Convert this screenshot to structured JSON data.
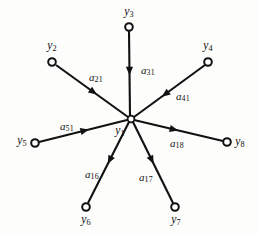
{
  "figure": {
    "kind": "signal-flow-graph",
    "background_color": "#fdfdfc",
    "ink_color": "#111111",
    "width": 258,
    "height": 235
  },
  "nodes": [
    {
      "id": "y1",
      "label": "y",
      "subscript": "1",
      "cx": 131,
      "cy": 119,
      "r": 3.4,
      "label_x": 120,
      "label_y": 132,
      "is_center": true
    },
    {
      "id": "y2",
      "label": "y",
      "subscript": "2",
      "cx": 52,
      "cy": 62,
      "r": 3.8,
      "label_x": 52,
      "label_y": 47,
      "is_center": false
    },
    {
      "id": "y3",
      "label": "y",
      "subscript": "3",
      "cx": 129,
      "cy": 27,
      "r": 3.8,
      "label_x": 129,
      "label_y": 13,
      "is_center": false
    },
    {
      "id": "y4",
      "label": "y",
      "subscript": "4",
      "cx": 208,
      "cy": 62,
      "r": 3.8,
      "label_x": 208,
      "label_y": 47,
      "is_center": false
    },
    {
      "id": "y5",
      "label": "y",
      "subscript": "5",
      "cx": 35,
      "cy": 143,
      "r": 3.8,
      "label_x": 22,
      "label_y": 142,
      "is_center": false
    },
    {
      "id": "y6",
      "label": "y",
      "subscript": "6",
      "cx": 86,
      "cy": 207,
      "r": 3.8,
      "label_x": 86,
      "label_y": 221,
      "is_center": false
    },
    {
      "id": "y7",
      "label": "y",
      "subscript": "7",
      "cx": 175,
      "cy": 207,
      "r": 3.8,
      "label_x": 176,
      "label_y": 221,
      "is_center": false
    },
    {
      "id": "y8",
      "label": "y",
      "subscript": "8",
      "cx": 227,
      "cy": 142,
      "r": 3.8,
      "label_x": 240,
      "label_y": 143,
      "is_center": false
    }
  ],
  "edges": [
    {
      "id": "a21",
      "label": "a",
      "subscript": "21",
      "from": "y2",
      "to": "y1",
      "x1": 56,
      "y1": 65,
      "x2": 128,
      "y2": 117,
      "arrow_t": 0.52,
      "label_x": 96,
      "label_y": 78
    },
    {
      "id": "a31",
      "label": "a",
      "subscript": "31",
      "from": "y3",
      "to": "y1",
      "x1": 129,
      "y1": 31,
      "x2": 130,
      "y2": 116,
      "arrow_t": 0.47,
      "label_x": 148,
      "label_y": 71
    },
    {
      "id": "a41",
      "label": "a",
      "subscript": "41",
      "from": "y4",
      "to": "y1",
      "x1": 205,
      "y1": 65,
      "x2": 134,
      "y2": 117,
      "arrow_t": 0.56,
      "label_x": 183,
      "label_y": 97
    },
    {
      "id": "a51",
      "label": "a",
      "subscript": "51",
      "from": "y5",
      "to": "y1",
      "x1": 39,
      "y1": 142,
      "x2": 127,
      "y2": 120,
      "arrow_t": 0.52,
      "label_x": 67,
      "label_y": 127
    },
    {
      "id": "a18",
      "label": "a",
      "subscript": "18",
      "from": "y1",
      "to": "y8",
      "x1": 134,
      "y1": 120,
      "x2": 223,
      "y2": 141,
      "arrow_t": 0.45,
      "label_x": 177,
      "label_y": 144
    },
    {
      "id": "a16",
      "label": "a",
      "subscript": "16",
      "from": "y1",
      "to": "y6",
      "x1": 129,
      "y1": 122,
      "x2": 88,
      "y2": 203,
      "arrow_t": 0.47,
      "label_x": 92,
      "label_y": 175
    },
    {
      "id": "a17",
      "label": "a",
      "subscript": "17",
      "from": "y1",
      "to": "y7",
      "x1": 133,
      "y1": 122,
      "x2": 173,
      "y2": 203,
      "arrow_t": 0.47,
      "label_x": 146,
      "label_y": 178
    }
  ]
}
